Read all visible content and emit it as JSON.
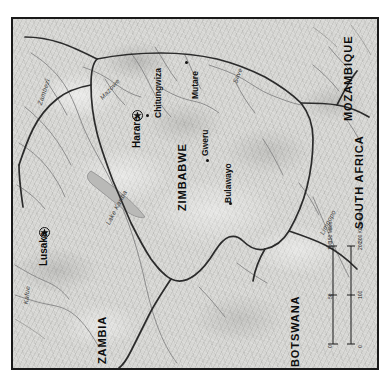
{
  "map": {
    "title": "Zimbabwe",
    "projection_note": "rotated",
    "background_color": "#d7d7d4",
    "frame_color": "#1a1a1a",
    "page_color": "#ffffff",
    "border_color": "#2b2b2b",
    "water_color": "#8d8d8d"
  },
  "countries": [
    {
      "name": "ZIMBABWE",
      "id": "zimbabwe"
    },
    {
      "name": "ZAMBIA",
      "id": "zambia"
    },
    {
      "name": "BOTSWANA",
      "id": "botswana"
    },
    {
      "name": "MOZAMBIQUE",
      "id": "mozambique"
    },
    {
      "name": "SOUTH AFRICA",
      "id": "south-africa"
    }
  ],
  "capitals": [
    {
      "name": "Harare",
      "id": "harare"
    },
    {
      "name": "Lusaka",
      "id": "lusaka"
    }
  ],
  "cities": [
    {
      "name": "Chitungwiza",
      "id": "chitungwiza"
    },
    {
      "name": "Mutare",
      "id": "mutare"
    },
    {
      "name": "Gweru",
      "id": "gweru"
    },
    {
      "name": "Bulawayo",
      "id": "bulawayo"
    }
  ],
  "water_features": [
    {
      "name": "Zambezi",
      "id": "zambezi"
    },
    {
      "name": "Mazowe",
      "id": "mazowe"
    },
    {
      "name": "Save",
      "id": "save"
    },
    {
      "name": "Lake Kariba",
      "id": "lake-kariba"
    },
    {
      "name": "Kafue",
      "id": "kafue"
    },
    {
      "name": "Limpopo",
      "id": "limpopo"
    }
  ],
  "scale": {
    "miles_label": "150 Miles",
    "kilometers_label": "300 Kilometers",
    "miles_ticks": [
      "0",
      "50",
      "100"
    ],
    "kilometers_ticks": [
      "0",
      "100",
      "200"
    ]
  }
}
